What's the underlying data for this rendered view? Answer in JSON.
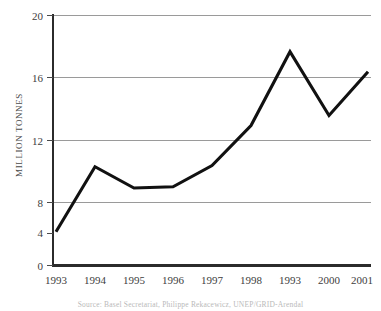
{
  "figure": {
    "y_axis_title": "MILLION TONNES",
    "source_caption": "Source: Basel Secretariat, Philippe Rekacewicz, UNEP/GRID-Arendal"
  },
  "colors": {
    "line": "#111111",
    "gridline": "#9a9a9a",
    "axis": "#2b2b2b",
    "text": "#3d3d3d",
    "background": "#ffffff"
  },
  "chart_data": {
    "type": "line",
    "title": "",
    "subtitle": "",
    "xlabel": "",
    "ylabel": "MILLION TONNES",
    "categories": [
      "1993",
      "1994",
      "1995",
      "1996",
      "1997",
      "1998",
      "1993",
      "2000",
      "2001"
    ],
    "values": [
      2.7,
      7.9,
      6.2,
      6.3,
      8.0,
      11.2,
      17.1,
      12.0,
      15.5
    ],
    "series": [
      {
        "name": "Hazardous waste generated",
        "values": [
          2.7,
          7.9,
          6.2,
          6.3,
          8.0,
          11.2,
          17.1,
          12.0,
          15.5
        ]
      }
    ],
    "ylim": [
      0,
      20
    ],
    "yticks": [
      0,
      4,
      8,
      12,
      16,
      20
    ],
    "ytick_labels": [
      "0",
      "4",
      "8",
      "12",
      "16",
      "20"
    ],
    "xtick_labels": [
      "1993",
      "1994",
      "1995",
      "1996",
      "1997",
      "1998",
      "1993",
      "2000",
      "2001"
    ],
    "grid": true,
    "grid_axis": "y",
    "legend": false,
    "legend_position": "none",
    "annotations": []
  }
}
